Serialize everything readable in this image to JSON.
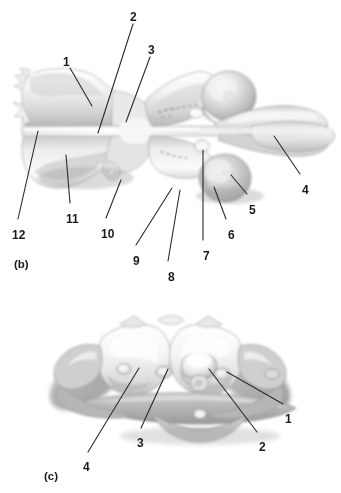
{
  "figure": {
    "style": "grayscale airbrush anatomical drawing",
    "background_color": "#ffffff",
    "label_color": "#1a1a1a",
    "leader_color": "#2b2b2b"
  },
  "panels": [
    {
      "id": "b",
      "caption": "(b)",
      "caption_pos": {
        "x": 14,
        "y": 258
      },
      "view": "dorsal view of atlas and axis",
      "labels": [
        {
          "text": "1",
          "x": 63,
          "y": 56,
          "leader": {
            "x1": 70,
            "y1": 68,
            "x2": 92,
            "y2": 106
          }
        },
        {
          "text": "2",
          "x": 130,
          "y": 11,
          "leader": {
            "x1": 133,
            "y1": 24,
            "x2": 98,
            "y2": 133
          }
        },
        {
          "text": "3",
          "x": 148,
          "y": 44,
          "leader": {
            "x1": 150,
            "y1": 57,
            "x2": 126,
            "y2": 122
          }
        },
        {
          "text": "4",
          "x": 302,
          "y": 184,
          "leader": {
            "x1": 300,
            "y1": 174,
            "x2": 274,
            "y2": 136
          }
        },
        {
          "text": "5",
          "x": 249,
          "y": 204,
          "leader": {
            "x1": 247,
            "y1": 194,
            "x2": 231,
            "y2": 175
          }
        },
        {
          "text": "6",
          "x": 228,
          "y": 229,
          "leader": {
            "x1": 226,
            "y1": 219,
            "x2": 214,
            "y2": 187
          }
        },
        {
          "text": "7",
          "x": 203,
          "y": 250,
          "leader": {
            "x1": 203,
            "y1": 240,
            "x2": 203,
            "y2": 150
          }
        },
        {
          "text": "8",
          "x": 168,
          "y": 271,
          "leader": {
            "x1": 168,
            "y1": 261,
            "x2": 180,
            "y2": 190
          }
        },
        {
          "text": "9",
          "x": 133,
          "y": 255,
          "leader": {
            "x1": 136,
            "y1": 245,
            "x2": 172,
            "y2": 188
          }
        },
        {
          "text": "10",
          "x": 101,
          "y": 228,
          "leader": {
            "x1": 106,
            "y1": 218,
            "x2": 121,
            "y2": 180
          }
        },
        {
          "text": "11",
          "x": 66,
          "y": 213,
          "leader": {
            "x1": 70,
            "y1": 203,
            "x2": 66,
            "y2": 155
          }
        },
        {
          "text": "12",
          "x": 12,
          "y": 229,
          "leader": {
            "x1": 18,
            "y1": 219,
            "x2": 38,
            "y2": 131
          }
        }
      ]
    },
    {
      "id": "c",
      "caption": "(c)",
      "caption_pos": {
        "x": 44,
        "y": 470
      },
      "view": "cranial view of atlas",
      "labels": [
        {
          "text": "1",
          "x": 285,
          "y": 413,
          "leader": {
            "x1": 283,
            "y1": 404,
            "x2": 227,
            "y2": 372
          }
        },
        {
          "text": "2",
          "x": 259,
          "y": 441,
          "leader": {
            "x1": 257,
            "y1": 432,
            "x2": 209,
            "y2": 369
          }
        },
        {
          "text": "3",
          "x": 137,
          "y": 437,
          "leader": {
            "x1": 141,
            "y1": 428,
            "x2": 168,
            "y2": 369
          }
        },
        {
          "text": "4",
          "x": 83,
          "y": 461,
          "leader": {
            "x1": 88,
            "y1": 452,
            "x2": 139,
            "y2": 368
          }
        }
      ]
    }
  ]
}
